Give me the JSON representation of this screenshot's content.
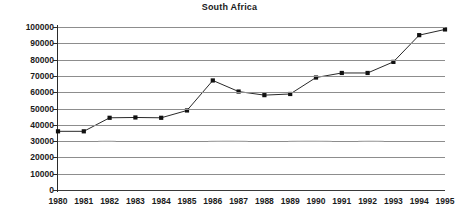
{
  "chart_data": {
    "type": "line",
    "title": "South Africa",
    "xlabel": "",
    "ylabel": "",
    "x": [
      1980,
      1981,
      1982,
      1983,
      1984,
      1985,
      1986,
      1987,
      1988,
      1989,
      1990,
      1991,
      1992,
      1993,
      1994,
      1995
    ],
    "categories": [
      "1980",
      "1981",
      "1982",
      "1983",
      "1984",
      "1985",
      "1986",
      "1987",
      "1988",
      "1989",
      "1990",
      "1991",
      "1992",
      "1993",
      "1994",
      "1995"
    ],
    "values": [
      36000,
      36000,
      44300,
      44500,
      44300,
      48800,
      67200,
      60400,
      58200,
      58900,
      69000,
      71800,
      71800,
      78600,
      95000,
      98500
    ],
    "series": [
      {
        "name": "South Africa",
        "values": [
          36000,
          36000,
          44300,
          44500,
          44300,
          48800,
          67200,
          60400,
          58200,
          58900,
          69000,
          71800,
          71800,
          78600,
          95000,
          98500
        ]
      }
    ],
    "ylim": [
      0,
      100000
    ],
    "xlim": [
      1980,
      1995
    ],
    "ytick_labels": [
      "0",
      "10000",
      "20000",
      "30000",
      "40000",
      "50000",
      "60000",
      "70000",
      "80000",
      "90000",
      "100000"
    ],
    "ytick_values": [
      0,
      10000,
      20000,
      30000,
      40000,
      50000,
      60000,
      70000,
      80000,
      90000,
      100000
    ],
    "grid": true,
    "grid_axis": "y",
    "legend": false,
    "legend_position": "none",
    "marker": "square",
    "line_color": "#111111",
    "marker_color": "#111111",
    "grid_color": "#8d8d8d"
  }
}
